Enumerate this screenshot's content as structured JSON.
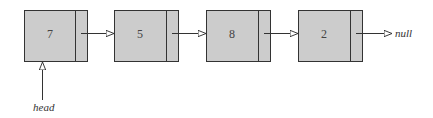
{
  "diagram": {
    "type": "singly-linked-list",
    "nodes": [
      {
        "value": "7"
      },
      {
        "value": "5"
      },
      {
        "value": "8"
      },
      {
        "value": "2"
      }
    ],
    "terminal_label": "null",
    "head_label": "head",
    "colors": {
      "node_fill": "#cccccc",
      "stroke": "#333333"
    }
  }
}
